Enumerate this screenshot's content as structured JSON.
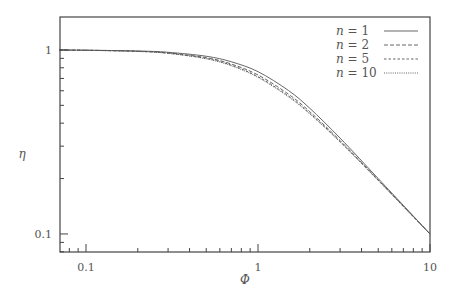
{
  "chart_data": {
    "type": "line",
    "title": "",
    "xlabel": "Φ",
    "ylabel": "η",
    "xscale": "log",
    "yscale": "log",
    "xlim": [
      0.0706,
      10
    ],
    "ylim": [
      0.0798,
      1.51
    ],
    "xticks": [
      {
        "value": 0.1,
        "label": "0.1"
      },
      {
        "value": 1,
        "label": "1"
      },
      {
        "value": 10,
        "label": "10"
      }
    ],
    "yticks": [
      {
        "value": 0.1,
        "label": "0.1"
      },
      {
        "value": 1,
        "label": "1"
      }
    ],
    "grid": false,
    "legend_position": "upper right",
    "x": [
      0.07,
      0.1,
      0.2,
      0.3,
      0.5,
      0.7,
      1,
      1.5,
      2,
      3,
      5,
      7,
      10
    ],
    "series": [
      {
        "name": "n = 1",
        "n": "1",
        "style": "solid",
        "values": [
          0.998,
          0.997,
          0.987,
          0.971,
          0.924,
          0.862,
          0.762,
          0.603,
          0.482,
          0.332,
          0.2,
          0.143,
          0.1
        ]
      },
      {
        "name": "n = 2",
        "n": "2",
        "style": "dashed",
        "values": [
          0.998,
          0.996,
          0.984,
          0.964,
          0.908,
          0.838,
          0.731,
          0.576,
          0.462,
          0.322,
          0.197,
          0.142,
          0.1
        ]
      },
      {
        "name": "n = 5",
        "n": "5",
        "style": "short-dashed",
        "values": [
          0.998,
          0.996,
          0.982,
          0.96,
          0.899,
          0.826,
          0.716,
          0.563,
          0.453,
          0.318,
          0.196,
          0.141,
          0.1
        ]
      },
      {
        "name": "n = 10",
        "n": "10",
        "style": "dotted",
        "values": [
          0.998,
          0.995,
          0.981,
          0.958,
          0.895,
          0.82,
          0.709,
          0.557,
          0.449,
          0.316,
          0.195,
          0.141,
          0.1
        ]
      }
    ]
  },
  "colors": {
    "axis": "#444444",
    "line": "#555555",
    "text": "#555555"
  }
}
